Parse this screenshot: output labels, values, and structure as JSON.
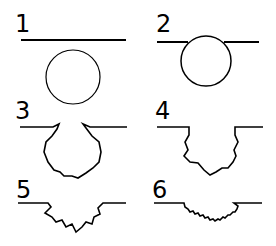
{
  "diagram": {
    "panels": [
      {
        "label": "1",
        "description": "circle separate below line"
      },
      {
        "label": "2",
        "description": "circle touching line"
      },
      {
        "label": "3",
        "description": "rounded wavy pit with narrow opening"
      },
      {
        "label": "4",
        "description": "wavy cavity with vertical-ish walls"
      },
      {
        "label": "5",
        "description": "shallow wavy depression"
      },
      {
        "label": "6",
        "description": "very shallow zigzag depression"
      }
    ],
    "colors": {
      "stroke": "#000000",
      "background": "#ffffff"
    }
  }
}
